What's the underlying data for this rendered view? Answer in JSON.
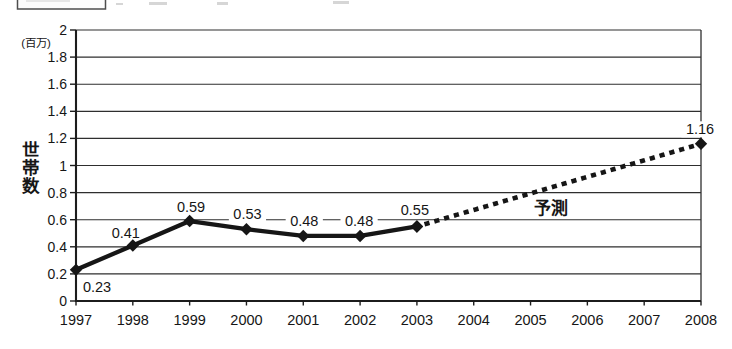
{
  "figure": {
    "kind": "scanned line chart (Japanese)",
    "background_color": "#ffffff",
    "ink_color": "#161616",
    "partial_box_top_left_visible": true
  },
  "chart_data": {
    "type": "line",
    "title": "",
    "ylabel": "世帯数",
    "y_unit": "(百万)",
    "xlabel": "",
    "ylim": [
      0,
      2
    ],
    "ytick_step": 0.2,
    "ytick_labels": [
      "2",
      "1.8",
      "1.6",
      "1.4",
      "1.2",
      "1",
      "0.8",
      "0.6",
      "0.4",
      "0.2",
      "0"
    ],
    "categories": [
      "1997",
      "1998",
      "1999",
      "2000",
      "2001",
      "2002",
      "2003",
      "2004",
      "2005",
      "2006",
      "2007",
      "2008"
    ],
    "grid": "horizontal",
    "legend": "none",
    "series": [
      {
        "name": "actual",
        "line_style": "solid",
        "marker": "diamond",
        "color": "#161616",
        "points": [
          {
            "category": "1997",
            "value": 0.23
          },
          {
            "category": "1998",
            "value": 0.41
          },
          {
            "category": "1999",
            "value": 0.59
          },
          {
            "category": "2000",
            "value": 0.53
          },
          {
            "category": "2001",
            "value": 0.48
          },
          {
            "category": "2002",
            "value": 0.48
          },
          {
            "category": "2003",
            "value": 0.55
          }
        ]
      },
      {
        "name": "forecast",
        "line_style": "dotted",
        "marker": "diamond",
        "color": "#161616",
        "points": [
          {
            "category": "2003",
            "value": 0.55
          },
          {
            "category": "2008",
            "value": 1.16
          }
        ]
      }
    ],
    "data_labels": [
      {
        "category": "1997",
        "text": "0.23"
      },
      {
        "category": "1998",
        "text": "0.41"
      },
      {
        "category": "1999",
        "text": "0.59"
      },
      {
        "category": "2000",
        "text": "0.53"
      },
      {
        "category": "2001",
        "text": "0.48"
      },
      {
        "category": "2002",
        "text": "0.48"
      },
      {
        "category": "2003",
        "text": "0.55"
      },
      {
        "category": "2008",
        "text": "1.16"
      }
    ],
    "annotations": [
      {
        "text": "予測",
        "x_index": 8.36,
        "value": 0.686
      }
    ]
  }
}
